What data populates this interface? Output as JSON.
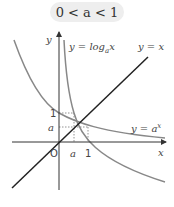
{
  "title": "0 < a < 1",
  "labels": {
    "y_axis": "y",
    "x_axis": "x",
    "origin": "O",
    "a_x": "a",
    "one_x": "1",
    "a_y": "a",
    "one_y": "1",
    "log_curve": "y = log",
    "log_sub": "a",
    "log_var": "x",
    "line": "y = x",
    "exp_curve": "y = a",
    "exp_sup": "x"
  },
  "colors": {
    "axis": "#333333",
    "line": "#222222",
    "curve": "#888888",
    "dotted": "#777777",
    "pill": "#eeeeee"
  }
}
